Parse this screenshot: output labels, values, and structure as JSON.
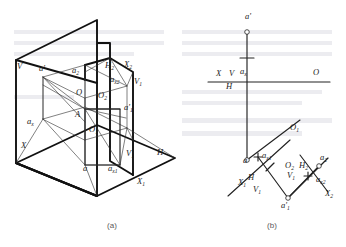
{
  "figure": {
    "captions": [
      {
        "id": "caption-a",
        "text": "(a)",
        "x": 112,
        "y": 228
      },
      {
        "id": "caption-b",
        "text": "(b)",
        "x": 272,
        "y": 228
      }
    ],
    "ink_color": "#111111",
    "label_color": "#1a1a1a",
    "caption_color": "#5a5a5a",
    "background": "#ffffff"
  },
  "pictorial": {
    "name": "figure-a-pictorial-view",
    "labels": [
      {
        "id": "label-V",
        "base": "V",
        "sub": "",
        "x": 17,
        "y": 69
      },
      {
        "id": "label-ap",
        "base": "a'",
        "sub": "",
        "x": 39,
        "y": 71
      },
      {
        "id": "label-a2",
        "base": "a",
        "sub": "2",
        "x": 72,
        "y": 73
      },
      {
        "id": "label-H2",
        "base": "H",
        "sub": "2",
        "x": 105,
        "y": 68
      },
      {
        "id": "label-X2",
        "base": "X",
        "sub": "2",
        "x": 124,
        "y": 67
      },
      {
        "id": "label-ax2",
        "base": "a",
        "sub": "x2",
        "x": 110,
        "y": 82
      },
      {
        "id": "label-V1-top",
        "base": "V",
        "sub": "1",
        "x": 134,
        "y": 84
      },
      {
        "id": "label-O",
        "base": "O",
        "sub": "",
        "x": 76,
        "y": 95
      },
      {
        "id": "label-O2",
        "base": "O",
        "sub": "2",
        "x": 98,
        "y": 98
      },
      {
        "id": "label-ap1",
        "base": "a'",
        "sub": "1",
        "x": 124,
        "y": 110
      },
      {
        "id": "label-A",
        "base": "A",
        "sub": "",
        "x": 75,
        "y": 117
      },
      {
        "id": "label-ax",
        "base": "a",
        "sub": "x",
        "x": 27,
        "y": 124
      },
      {
        "id": "label-O1",
        "base": "O",
        "sub": "1",
        "x": 89,
        "y": 132
      },
      {
        "id": "label-X",
        "base": "X",
        "sub": "",
        "x": 21,
        "y": 148
      },
      {
        "id": "label-V1-bot",
        "base": "V",
        "sub": "1",
        "x": 126,
        "y": 156
      },
      {
        "id": "label-a",
        "base": "a",
        "sub": "",
        "x": 83,
        "y": 171
      },
      {
        "id": "label-ax1",
        "base": "a",
        "sub": "x1",
        "x": 108,
        "y": 171
      },
      {
        "id": "label-H",
        "base": "H",
        "sub": "",
        "x": 157,
        "y": 155
      },
      {
        "id": "label-X1",
        "base": "X",
        "sub": "1",
        "x": 137,
        "y": 184
      }
    ]
  },
  "orthographic": {
    "name": "figure-b-projection-view",
    "labels": [
      {
        "id": "label-b-ap",
        "base": "a'",
        "sub": "",
        "x": 245,
        "y": 19
      },
      {
        "id": "label-b-X",
        "base": "X",
        "sub": "",
        "x": 216,
        "y": 76
      },
      {
        "id": "label-b-V",
        "base": "V",
        "sub": "",
        "x": 229,
        "y": 76
      },
      {
        "id": "label-b-ax",
        "base": "a",
        "sub": "x",
        "x": 240,
        "y": 74
      },
      {
        "id": "label-b-H",
        "base": "H",
        "sub": "",
        "x": 226,
        "y": 89
      },
      {
        "id": "label-b-O",
        "base": "O",
        "sub": "",
        "x": 313,
        "y": 75
      },
      {
        "id": "label-b-a",
        "base": "a",
        "sub": "",
        "x": 243,
        "y": 163
      },
      {
        "id": "label-b-ax1",
        "base": "a",
        "sub": "x1",
        "x": 262,
        "y": 158
      },
      {
        "id": "label-b-O1",
        "base": "O",
        "sub": "1",
        "x": 290,
        "y": 130
      },
      {
        "id": "label-b-X1",
        "base": "X",
        "sub": "1",
        "x": 238,
        "y": 185
      },
      {
        "id": "label-b-H-2",
        "base": "H",
        "sub": "",
        "x": 248,
        "y": 180
      },
      {
        "id": "label-b-V1",
        "base": "V",
        "sub": "1",
        "x": 253,
        "y": 192
      },
      {
        "id": "label-b-O2",
        "base": "O",
        "sub": "2",
        "x": 285,
        "y": 168
      },
      {
        "id": "label-b-V1b",
        "base": "V",
        "sub": "1",
        "x": 287,
        "y": 178
      },
      {
        "id": "label-b-H2",
        "base": "H",
        "sub": "2",
        "x": 299,
        "y": 168
      },
      {
        "id": "label-b-a2",
        "base": "a",
        "sub": "2",
        "x": 320,
        "y": 160
      },
      {
        "id": "label-b-ax2",
        "base": "a",
        "sub": "x2",
        "x": 316,
        "y": 182
      },
      {
        "id": "label-b-X2",
        "base": "X",
        "sub": "2",
        "x": 325,
        "y": 196
      },
      {
        "id": "label-b-ap1",
        "base": "a'",
        "sub": "1",
        "x": 281,
        "y": 208
      }
    ]
  }
}
